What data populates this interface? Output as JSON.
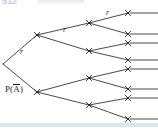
{
  "page": {
    "number": "512",
    "width": 158,
    "height": 131,
    "background": "#ffffff",
    "rule_color": "#d8e6f2",
    "page_number_color": "#b9cfe0"
  },
  "diagram": {
    "kind": "probability-tree-diagram",
    "title": "",
    "stroke_color": "#1c1c1c",
    "node_marker": "x-cross",
    "levels": 4,
    "branching_factor": 2,
    "terminal_count": 8,
    "labels": [
      {
        "id": "branch-label-level1-upper",
        "text": "r",
        "x": 20,
        "y": 47
      },
      {
        "id": "branch-label-level2-upper",
        "text": "r",
        "x": 63,
        "y": 25
      },
      {
        "id": "branch-label-level3-upper",
        "text": "r",
        "x": 106,
        "y": 8
      },
      {
        "id": "root-probability-label",
        "text": "P(A̅)",
        "base": "P(",
        "over": "A",
        "close": ")",
        "x": 5,
        "y": 84
      }
    ],
    "nodes": {
      "root": {
        "id": "n0",
        "x": 3,
        "y": 64
      },
      "level2": [
        {
          "id": "n1",
          "x": 37,
          "y": 35
        },
        {
          "id": "n2",
          "x": 37,
          "y": 92
        }
      ],
      "level3": [
        {
          "id": "n3",
          "x": 89,
          "y": 23
        },
        {
          "id": "n4",
          "x": 89,
          "y": 51
        },
        {
          "id": "n5",
          "x": 89,
          "y": 78
        },
        {
          "id": "n6",
          "x": 89,
          "y": 105
        }
      ],
      "terminal": [
        {
          "id": "t1",
          "x": 128,
          "y": 13
        },
        {
          "id": "t2",
          "x": 128,
          "y": 34
        },
        {
          "id": "t3",
          "x": 128,
          "y": 43
        },
        {
          "id": "t4",
          "x": 128,
          "y": 60
        },
        {
          "id": "t5",
          "x": 128,
          "y": 69
        },
        {
          "id": "t6",
          "x": 128,
          "y": 89
        },
        {
          "id": "t7",
          "x": 128,
          "y": 98
        },
        {
          "id": "t8",
          "x": 128,
          "y": 119
        }
      ]
    },
    "edges": [
      {
        "from": "n0",
        "to": "n1"
      },
      {
        "from": "n0",
        "to": "n2"
      },
      {
        "from": "n1",
        "to": "n3"
      },
      {
        "from": "n1",
        "to": "n4"
      },
      {
        "from": "n2",
        "to": "n5"
      },
      {
        "from": "n2",
        "to": "n6"
      },
      {
        "from": "n3",
        "to": "t1"
      },
      {
        "from": "n3",
        "to": "t2"
      },
      {
        "from": "n4",
        "to": "t3"
      },
      {
        "from": "n4",
        "to": "t4"
      },
      {
        "from": "n5",
        "to": "t5"
      },
      {
        "from": "n5",
        "to": "t6"
      },
      {
        "from": "n6",
        "to": "t7"
      },
      {
        "from": "n6",
        "to": "t8"
      }
    ],
    "terminal_tails": [
      {
        "id": "tail1",
        "x1": 130,
        "y": 13,
        "x2": 158
      },
      {
        "id": "tail2",
        "x1": 130,
        "y": 34,
        "x2": 158
      },
      {
        "id": "tail3",
        "x1": 130,
        "y": 43,
        "x2": 158
      },
      {
        "id": "tail4",
        "x1": 130,
        "y": 60,
        "x2": 158
      },
      {
        "id": "tail5",
        "x1": 130,
        "y": 69,
        "x2": 158
      },
      {
        "id": "tail6",
        "x1": 130,
        "y": 89,
        "x2": 158
      },
      {
        "id": "tail7",
        "x1": 130,
        "y": 98,
        "x2": 158
      },
      {
        "id": "tail8",
        "x1": 130,
        "y": 119,
        "x2": 158
      }
    ]
  }
}
